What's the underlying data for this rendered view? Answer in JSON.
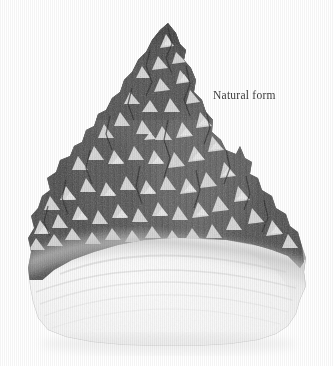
{
  "page": {
    "kind": "scanned-plate",
    "background_color": "#ffffff",
    "width": 333,
    "height": 366
  },
  "figure": {
    "name": "crystal-specimen",
    "colors": {
      "matrix_dark": "#4e4e4e",
      "matrix_mid": "#6e6e6e",
      "matrix_light": "#9a9a9a",
      "facet_light": "#d8d8d8",
      "facet_highlight": "#efefef",
      "base_pale": "#f2f2f2",
      "base_shadow": "#e2e2e2",
      "outline": "#5a5a5a"
    }
  },
  "annotations": [
    {
      "id": "natural-form",
      "text": "Natural form",
      "color": "#3b3b3b",
      "x": 213,
      "y": 88
    }
  ]
}
